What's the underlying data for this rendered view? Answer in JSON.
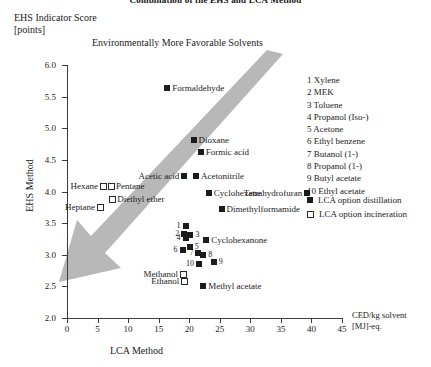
{
  "chart_data": {
    "type": "scatter",
    "title": "Combination of the EHS and LCA Method",
    "annotation": "Environmentally More Favorable Solvents",
    "xlabel": "LCA Method",
    "ylabel": "EHS Method",
    "y_axis_caption_line1": "EHS Indicator Score",
    "y_axis_caption_line2": "[points]",
    "x_unit_line1": "CED/kg solvent",
    "x_unit_line2": "[MJ]-eq.",
    "xlim": [
      0,
      45
    ],
    "ylim": [
      2.0,
      6.0
    ],
    "xticks": [
      0,
      5,
      10,
      15,
      20,
      25,
      30,
      35,
      40,
      45
    ],
    "yticks": [
      "2.0",
      "2.5",
      "3.0",
      "3.5",
      "4.0",
      "4.5",
      "5.0",
      "5.5",
      "6.0"
    ],
    "grid": false,
    "legend_position": "right",
    "series": [
      {
        "name": "LCA option distillation",
        "marker": "filled-square",
        "color": "#1b1b1b",
        "points": [
          {
            "label": "Formaldehyde",
            "x": 16.4,
            "y": 5.63,
            "label_side": "right"
          },
          {
            "label": "Dioxane",
            "x": 20.7,
            "y": 4.82,
            "label_side": "right"
          },
          {
            "label": "Formic acid",
            "x": 21.9,
            "y": 4.63,
            "label_side": "right"
          },
          {
            "label": "Acetic acid",
            "x": 19.2,
            "y": 4.25,
            "label_side": "left"
          },
          {
            "label": "Acetonitrile",
            "x": 21.1,
            "y": 4.25,
            "label_side": "right"
          },
          {
            "label": "Cyclohexane",
            "x": 23.2,
            "y": 3.98,
            "label_side": "right"
          },
          {
            "label": "Tetrahydrofuran",
            "x": 39.3,
            "y": 3.98,
            "label_side": "left"
          },
          {
            "label": "Dimethylformamide",
            "x": 25.3,
            "y": 3.73,
            "label_side": "right"
          },
          {
            "label": "Cyclohexanone",
            "x": 22.8,
            "y": 3.24,
            "label_side": "right"
          },
          {
            "label": "Methyl acetate",
            "x": 22.3,
            "y": 2.5,
            "label_side": "right"
          },
          {
            "label": "Xylene",
            "x": 19.4,
            "y": 3.46,
            "number": "1",
            "num_side": "left"
          },
          {
            "label": "MEK",
            "x": 19.2,
            "y": 3.33,
            "number": "2",
            "num_side": "left"
          },
          {
            "label": "Toluene",
            "x": 20.2,
            "y": 3.32,
            "number": "3",
            "num_side": "right"
          },
          {
            "label": "Propanol (Iso-)",
            "x": 19.4,
            "y": 3.26,
            "number": "4",
            "num_side": "left"
          },
          {
            "label": "Acetone",
            "x": 20.1,
            "y": 3.13,
            "number": "5",
            "num_side": "right"
          },
          {
            "label": "Ethyl benzene",
            "x": 18.9,
            "y": 3.08,
            "number": "6",
            "num_side": "left"
          },
          {
            "label": "Butanol (1-)",
            "x": 21.5,
            "y": 3.02,
            "number": "7",
            "num_side": "left"
          },
          {
            "label": "Propanol (1-)",
            "x": 22.3,
            "y": 3.0,
            "number": "8",
            "num_side": "right"
          },
          {
            "label": "Butyl acetate",
            "x": 24.0,
            "y": 2.88,
            "number": "9",
            "num_side": "right"
          },
          {
            "label": "Ethyl acetate",
            "x": 21.6,
            "y": 2.86,
            "number": "10",
            "num_side": "left"
          }
        ]
      },
      {
        "name": "LCA option incineration",
        "marker": "open-square",
        "color": "#2a2a2a",
        "points": [
          {
            "label": "Hexane",
            "x": 5.9,
            "y": 4.09,
            "label_side": "left"
          },
          {
            "label": "Pentane",
            "x": 7.2,
            "y": 4.09,
            "label_side": "right"
          },
          {
            "label": "Diethyl ether",
            "x": 7.4,
            "y": 3.88,
            "label_side": "right"
          },
          {
            "label": "Heptane",
            "x": 5.4,
            "y": 3.75,
            "label_side": "left"
          },
          {
            "label": "Methanol",
            "x": 19.0,
            "y": 2.7,
            "label_side": "left"
          },
          {
            "label": "Ethanol",
            "x": 19.2,
            "y": 2.59,
            "label_side": "left"
          }
        ]
      }
    ],
    "numbered_legend": [
      {
        "n": "1",
        "name": "Xylene"
      },
      {
        "n": "2",
        "name": "MEK"
      },
      {
        "n": "3",
        "name": "Toluene"
      },
      {
        "n": "4",
        "name": "Propanol (Iso-)"
      },
      {
        "n": "5",
        "name": "Acetone"
      },
      {
        "n": "6",
        "name": "Ethyl benzene"
      },
      {
        "n": "7",
        "name": "Butanol (1-)"
      },
      {
        "n": "8",
        "name": "Propanol (1-)"
      },
      {
        "n": "9",
        "name": "Butyl acetate"
      },
      {
        "n": "10",
        "name": "Ethyl acetate"
      }
    ],
    "series_legend": [
      {
        "marker": "filled-square",
        "label": "LCA option distillation"
      },
      {
        "marker": "open-square",
        "label": "LCA option incineration"
      }
    ]
  }
}
